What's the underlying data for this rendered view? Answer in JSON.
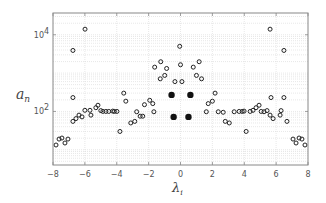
{
  "chart_data": {
    "type": "scatter",
    "title": "",
    "xlabel": "λ_i",
    "ylabel": "a_n",
    "xlabel_main": "λ",
    "xlabel_sub": "i",
    "ylabel_main": "a",
    "ylabel_sub": "n",
    "xlim": [
      -8,
      8
    ],
    "ylim": [
      4,
      37000
    ],
    "yscale": "log",
    "grid": true,
    "xticks": [
      -8,
      -6,
      -4,
      -2,
      0,
      2,
      4,
      6,
      8
    ],
    "xtick_labels": [
      "−8",
      "−6",
      "−4",
      "−2",
      "0",
      "2",
      "4",
      "6",
      "8"
    ],
    "yticks": [
      100,
      10000
    ],
    "ytick_labels": [
      "10",
      "10"
    ],
    "ytick_exponents": [
      "2",
      "4"
    ],
    "legend": null,
    "colors": {
      "marker_edge": "#222222",
      "filled_marker": "#111111",
      "grid": "#d8d8d8",
      "frame": "#888888"
    },
    "series": [
      {
        "name": "open markers",
        "marker": "open-circle",
        "points": [
          [
            -7.81,
            13.3
          ],
          [
            -7.62,
            19.0
          ],
          [
            -7.44,
            20.2
          ],
          [
            -7.25,
            15.0
          ],
          [
            -7.06,
            19.0
          ],
          [
            -6.75,
            55
          ],
          [
            -6.75,
            3900
          ],
          [
            -6.75,
            230
          ],
          [
            -6.56,
            65
          ],
          [
            -6.37,
            80
          ],
          [
            -6.18,
            72
          ],
          [
            -6.0,
            107
          ],
          [
            -5.99,
            14000
          ],
          [
            -5.68,
            107
          ],
          [
            -5.62,
            80
          ],
          [
            -5.31,
            125
          ],
          [
            -5.18,
            145
          ],
          [
            -5.0,
            105
          ],
          [
            -4.87,
            100
          ],
          [
            -4.68,
            100
          ],
          [
            -4.5,
            100
          ],
          [
            -4.25,
            102
          ],
          [
            -4.15,
            100
          ],
          [
            -3.99,
            100
          ],
          [
            -3.8,
            30
          ],
          [
            -3.56,
            300
          ],
          [
            -3.43,
            185
          ],
          [
            -3.12,
            50
          ],
          [
            -2.87,
            55
          ],
          [
            -2.75,
            98
          ],
          [
            -2.53,
            75
          ],
          [
            -2.37,
            75
          ],
          [
            -2.26,
            150
          ],
          [
            -1.93,
            195
          ],
          [
            -1.67,
            98
          ],
          [
            -1.74,
            160
          ],
          [
            -1.24,
            1980
          ],
          [
            -1.62,
            1430
          ],
          [
            -0.87,
            1320
          ],
          [
            -0.99,
            870
          ],
          [
            -1.27,
            710
          ],
          [
            -0.35,
            600
          ],
          [
            0.09,
            600
          ],
          [
            -0.05,
            5000
          ],
          [
            0.0,
            1650
          ],
          [
            1.17,
            1980
          ],
          [
            0.8,
            1430
          ],
          [
            1.0,
            870
          ],
          [
            1.32,
            710
          ],
          [
            1.74,
            160
          ],
          [
            1.62,
            98
          ],
          [
            2.17,
            300
          ],
          [
            2.0,
            185
          ],
          [
            2.37,
            98
          ],
          [
            2.68,
            95
          ],
          [
            2.81,
            55
          ],
          [
            3.06,
            50
          ],
          [
            3.37,
            98
          ],
          [
            3.68,
            100
          ],
          [
            3.87,
            100
          ],
          [
            3.99,
            102
          ],
          [
            4.12,
            30
          ],
          [
            4.37,
            100
          ],
          [
            4.55,
            107
          ],
          [
            4.74,
            125
          ],
          [
            4.93,
            145
          ],
          [
            5.06,
            100
          ],
          [
            5.24,
            98
          ],
          [
            5.43,
            105
          ],
          [
            5.62,
            80
          ],
          [
            5.81,
            65
          ],
          [
            5.68,
            230
          ],
          [
            5.62,
            14000
          ],
          [
            6.31,
            105
          ],
          [
            6.25,
            80
          ],
          [
            6.49,
            3900
          ],
          [
            6.49,
            230
          ],
          [
            6.68,
            55
          ],
          [
            7.06,
            19.0
          ],
          [
            7.25,
            15.0
          ],
          [
            7.44,
            20.2
          ],
          [
            7.62,
            19.0
          ],
          [
            7.81,
            13.3
          ]
        ]
      },
      {
        "name": "filled markers",
        "marker": "filled-circle",
        "points": [
          [
            -0.56,
            270
          ],
          [
            0.62,
            270
          ],
          [
            -0.43,
            72
          ],
          [
            0.5,
            72
          ]
        ]
      }
    ]
  }
}
